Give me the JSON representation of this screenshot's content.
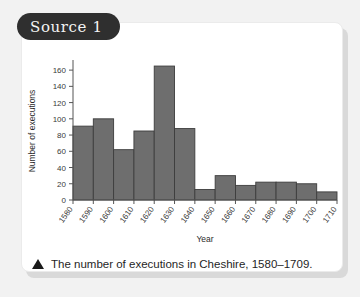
{
  "card": {
    "source_label": "Source 1",
    "caption": "The number of executions in Cheshire, 1580–1709.",
    "caption_marker": "triangle-up-icon"
  },
  "colors": {
    "page_background": "#f2f2f2",
    "card_background": "#ffffff",
    "pill_background": "#2f2f2f",
    "pill_text": "#f4f4f4",
    "bar_fill": "#6e6e6e",
    "bar_stroke": "#3d3d3d",
    "axis": "#555555",
    "text": "#2b2b2b"
  },
  "chart_data": {
    "type": "bar",
    "title": "",
    "xlabel": "Year",
    "ylabel": "Number of executions",
    "categories": [
      "1580",
      "1590",
      "1600",
      "1610",
      "1620",
      "1630",
      "1640",
      "1650",
      "1660",
      "1670",
      "1680",
      "1690",
      "1700"
    ],
    "values": [
      91,
      100,
      62,
      85,
      165,
      88,
      13,
      30,
      18,
      22,
      22,
      20,
      10
    ],
    "x_tick_labels": [
      "1580",
      "1590",
      "1600",
      "1610",
      "1620",
      "1630",
      "1640",
      "1650",
      "1660",
      "1670",
      "1680",
      "1690",
      "1700",
      "1710"
    ],
    "y_tick_labels": [
      "0",
      "20",
      "40",
      "60",
      "80",
      "100",
      "120",
      "140",
      "160"
    ],
    "y_ticks": [
      0,
      20,
      40,
      60,
      80,
      100,
      120,
      140,
      160
    ],
    "ylim": [
      0,
      170
    ],
    "xlim": [
      1580,
      1710
    ],
    "bin_width": 10,
    "grid": false,
    "legend": false
  }
}
